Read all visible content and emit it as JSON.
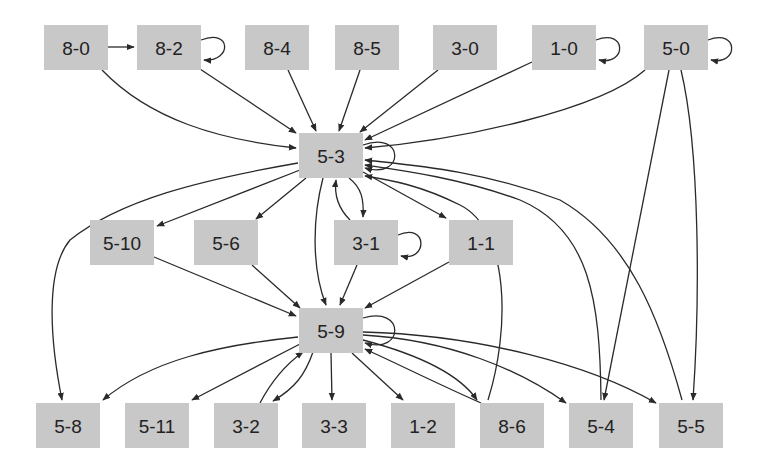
{
  "diagram": {
    "type": "directed-graph",
    "colors": {
      "node_fill": "#c8c8c8",
      "edge": "#2a2a2a",
      "label": "#222222",
      "background": "#ffffff"
    },
    "nodes": [
      {
        "id": "8-0",
        "label": "8-0",
        "x": 44,
        "y": 25,
        "w": 64,
        "h": 45
      },
      {
        "id": "8-2",
        "label": "8-2",
        "x": 137,
        "y": 25,
        "w": 64,
        "h": 45
      },
      {
        "id": "8-4",
        "label": "8-4",
        "x": 245,
        "y": 25,
        "w": 64,
        "h": 45
      },
      {
        "id": "8-5",
        "label": "8-5",
        "x": 335,
        "y": 25,
        "w": 64,
        "h": 45
      },
      {
        "id": "3-0",
        "label": "3-0",
        "x": 433,
        "y": 25,
        "w": 64,
        "h": 45
      },
      {
        "id": "1-0",
        "label": "1-0",
        "x": 532,
        "y": 25,
        "w": 64,
        "h": 45
      },
      {
        "id": "5-0",
        "label": "5-0",
        "x": 644,
        "y": 25,
        "w": 64,
        "h": 45
      },
      {
        "id": "5-3",
        "label": "5-3",
        "x": 299,
        "y": 133,
        "w": 64,
        "h": 45
      },
      {
        "id": "5-10",
        "label": "5-10",
        "x": 90,
        "y": 220,
        "w": 64,
        "h": 45
      },
      {
        "id": "5-6",
        "label": "5-6",
        "x": 194,
        "y": 220,
        "w": 64,
        "h": 45
      },
      {
        "id": "3-1",
        "label": "3-1",
        "x": 334,
        "y": 220,
        "w": 64,
        "h": 45
      },
      {
        "id": "1-1",
        "label": "1-1",
        "x": 449,
        "y": 220,
        "w": 64,
        "h": 45
      },
      {
        "id": "5-9",
        "label": "5-9",
        "x": 299,
        "y": 308,
        "w": 64,
        "h": 45
      },
      {
        "id": "5-8",
        "label": "5-8",
        "x": 36,
        "y": 403,
        "w": 64,
        "h": 45
      },
      {
        "id": "5-11",
        "label": "5-11",
        "x": 125,
        "y": 403,
        "w": 64,
        "h": 45
      },
      {
        "id": "3-2",
        "label": "3-2",
        "x": 214,
        "y": 403,
        "w": 64,
        "h": 45
      },
      {
        "id": "3-3",
        "label": "3-3",
        "x": 302,
        "y": 403,
        "w": 64,
        "h": 45
      },
      {
        "id": "1-2",
        "label": "1-2",
        "x": 391,
        "y": 403,
        "w": 64,
        "h": 45
      },
      {
        "id": "8-6",
        "label": "8-6",
        "x": 480,
        "y": 403,
        "w": 64,
        "h": 45
      },
      {
        "id": "5-4",
        "label": "5-4",
        "x": 569,
        "y": 403,
        "w": 64,
        "h": 45
      },
      {
        "id": "5-5",
        "label": "5-5",
        "x": 659,
        "y": 403,
        "w": 64,
        "h": 45
      }
    ],
    "edges": [
      {
        "from": "8-0",
        "to": "8-2",
        "path": "M108,47 L134,47"
      },
      {
        "from": "8-2",
        "to": "8-2",
        "path": "M201,40 C232,28 232,62 204,60"
      },
      {
        "from": "1-0",
        "to": "1-0",
        "path": "M596,40 C627,28 627,66 599,60"
      },
      {
        "from": "5-0",
        "to": "5-0",
        "path": "M708,40 C739,28 739,66 711,60"
      },
      {
        "from": "8-0",
        "to": "5-3",
        "path": "M102,70 C150,120 220,140 296,148"
      },
      {
        "from": "8-2",
        "to": "5-3",
        "path": "M200,69 L296,133"
      },
      {
        "from": "8-4",
        "to": "5-3",
        "path": "M288,70 L316,131"
      },
      {
        "from": "8-5",
        "to": "5-3",
        "path": "M360,70 L339,131"
      },
      {
        "from": "3-0",
        "to": "5-3",
        "path": "M438,70 L360,132"
      },
      {
        "from": "1-0",
        "to": "5-3",
        "path": "M532,62 L365,140"
      },
      {
        "from": "5-0",
        "to": "5-3",
        "path": "M645,70 C600,110 460,140 365,148"
      },
      {
        "from": "5-3",
        "to": "5-3",
        "path": "M363,145 C405,130 405,180 365,168"
      },
      {
        "from": "5-3",
        "to": "5-8",
        "path": "M298,163 C200,180 120,200 70,240 C45,270 50,340 62,400"
      },
      {
        "from": "5-3",
        "to": "5-10",
        "path": "M300,170 L157,226"
      },
      {
        "from": "5-3",
        "to": "5-6",
        "path": "M306,178 L256,219"
      },
      {
        "from": "5-3",
        "to": "5-9",
        "path": "M323,178 C312,220 312,270 326,305"
      },
      {
        "from": "3-1",
        "to": "5-3",
        "path": "M350,220 C338,208 334,195 336,180"
      },
      {
        "from": "5-3",
        "to": "3-1",
        "path": "M349,178 C362,188 364,200 363,217"
      },
      {
        "from": "5-3",
        "to": "1-1",
        "path": "M363,172 L446,218"
      },
      {
        "from": "3-1",
        "to": "3-1",
        "path": "M398,235 C428,222 428,262 401,256"
      },
      {
        "from": "8-6",
        "to": "5-3",
        "path": "M488,400 C510,330 510,230 460,205 C420,185 390,180 365,176"
      },
      {
        "from": "5-4",
        "to": "5-3",
        "path": "M601,400 C600,300 590,230 520,200 C460,178 400,170 365,165"
      },
      {
        "from": "5-5",
        "to": "5-3",
        "path": "M682,400 C660,320 630,240 560,200 C480,170 410,165 365,160"
      },
      {
        "from": "5-0",
        "to": "5-4",
        "path": "M669,70 L604,400"
      },
      {
        "from": "5-0",
        "to": "5-5",
        "path": "M681,70 C700,150 700,300 693,400"
      },
      {
        "from": "5-10",
        "to": "5-9",
        "path": "M154,257 L296,316"
      },
      {
        "from": "5-6",
        "to": "5-9",
        "path": "M252,265 L300,308"
      },
      {
        "from": "3-1",
        "to": "5-9",
        "path": "M357,265 L340,305"
      },
      {
        "from": "1-1",
        "to": "5-9",
        "path": "M449,262 L365,308"
      },
      {
        "from": "5-9",
        "to": "5-9",
        "path": "M363,318 C405,305 405,355 365,343"
      },
      {
        "from": "5-9",
        "to": "5-8",
        "path": "M298,337 C220,345 150,360 103,400"
      },
      {
        "from": "5-9",
        "to": "5-11",
        "path": "M300,344 L192,400"
      },
      {
        "from": "3-2",
        "to": "5-9",
        "path": "M260,403 C272,380 285,365 303,352"
      },
      {
        "from": "5-9",
        "to": "3-2",
        "path": "M313,352 C305,375 295,388 273,401"
      },
      {
        "from": "5-9",
        "to": "3-3",
        "path": "M331,353 L332,400"
      },
      {
        "from": "5-9",
        "to": "1-2",
        "path": "M352,353 L403,400"
      },
      {
        "from": "8-6",
        "to": "5-9",
        "path": "M481,403 C440,385 400,365 365,349"
      },
      {
        "from": "5-9",
        "to": "8-6",
        "path": "M363,340 C420,355 460,375 477,400"
      },
      {
        "from": "5-9",
        "to": "5-4",
        "path": "M363,335 C450,340 520,370 566,403"
      },
      {
        "from": "5-9",
        "to": "5-5",
        "path": "M363,332 C480,335 590,365 656,403"
      }
    ]
  }
}
